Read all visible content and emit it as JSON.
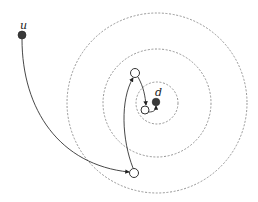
{
  "diagram": {
    "labels": {
      "source": "u",
      "destination": "d"
    },
    "rings": [
      {
        "name": "outer-ring",
        "r": 90
      },
      {
        "name": "middle-ring",
        "r": 54
      },
      {
        "name": "inner-ring",
        "r": 21
      }
    ],
    "colors": {
      "ring": "#8a8a8a",
      "path": "#333333",
      "filled_node": "#3a3a3a",
      "open_node": "#ffffff"
    }
  }
}
